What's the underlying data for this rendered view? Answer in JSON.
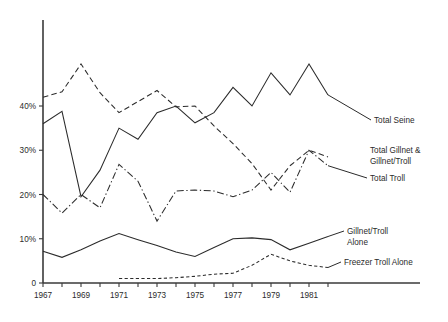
{
  "chart_data": {
    "type": "line",
    "title": "",
    "xlabel": "",
    "ylabel": "",
    "xlim": [
      1967,
      1983
    ],
    "ylim": [
      0,
      52
    ],
    "grid": false,
    "legend_position": "right-inline-labels",
    "x_tick_labels": [
      "1967",
      "1969",
      "1971",
      "1973",
      "1975",
      "1977",
      "1979",
      "1981"
    ],
    "x_tick_values": [
      1967,
      1969,
      1971,
      1973,
      1975,
      1977,
      1979,
      1981
    ],
    "x_minor_ticks": [
      1968,
      1970,
      1972,
      1974,
      1976,
      1978,
      1980,
      1982
    ],
    "y_tick_labels": [
      "0",
      "10%",
      "20%",
      "30%",
      "40%"
    ],
    "y_tick_values": [
      0,
      10,
      20,
      30,
      40
    ],
    "x": [
      1967,
      1968,
      1969,
      1970,
      1971,
      1972,
      1973,
      1974,
      1975,
      1976,
      1977,
      1978,
      1979,
      1980,
      1981,
      1982
    ],
    "series": [
      {
        "name": "Total Seine",
        "style": "solid",
        "label": "Total Seine",
        "values": [
          36.0,
          38.8,
          19.5,
          25.5,
          35.0,
          32.5,
          38.5,
          40.0,
          36.2,
          38.5,
          44.2,
          40.0,
          47.5,
          42.5,
          49.5,
          42.5
        ]
      },
      {
        "name": "Total Gillnet & Gillnet/Troll",
        "style": "dashed",
        "label": "Total Gillnet &\nGillnet/Troll",
        "label_line1": "Total Gillnet &",
        "label_line2": "Gillnet/Troll",
        "values": [
          42.0,
          43.2,
          49.5,
          43.0,
          38.5,
          41.0,
          43.5,
          39.8,
          40.0,
          35.5,
          31.5,
          27.0,
          21.0,
          26.5,
          30.0,
          28.5
        ]
      },
      {
        "name": "Total Troll",
        "style": "dashdot",
        "label": "Total Troll",
        "values": [
          20.0,
          15.8,
          20.0,
          17.0,
          26.8,
          23.0,
          14.0,
          20.8,
          21.0,
          20.8,
          19.5,
          21.0,
          25.0,
          20.5,
          30.0,
          26.5
        ]
      },
      {
        "name": "Gillnet/Troll Alone",
        "style": "solid",
        "label": "Gillnet/Troll\nAlone",
        "label_line1": "Gillnet/Troll",
        "label_line2": "Alone",
        "values": [
          7.2,
          5.8,
          7.5,
          9.5,
          11.2,
          9.8,
          8.5,
          7.0,
          6.0,
          8.0,
          10.0,
          10.2,
          9.8,
          7.5,
          9.0,
          10.5
        ]
      },
      {
        "name": "Freezer Troll Alone",
        "style": "fine-dashed",
        "label": "Freezer Troll Alone",
        "values": [
          null,
          null,
          null,
          null,
          1.0,
          1.0,
          1.0,
          1.2,
          1.5,
          2.0,
          2.2,
          4.0,
          6.5,
          5.0,
          4.0,
          3.5
        ]
      }
    ],
    "annotations": [
      {
        "id": "label-total-seine",
        "text": "Total Seine"
      },
      {
        "id": "label-total-gillnet",
        "text": "Total Gillnet & Gillnet/Troll"
      },
      {
        "id": "label-total-troll",
        "text": "Total Troll"
      },
      {
        "id": "label-gillnet-troll-alone",
        "text": "Gillnet/Troll Alone"
      },
      {
        "id": "label-freezer-troll-alone",
        "text": "Freezer Troll Alone"
      }
    ]
  },
  "axis": {
    "y_ticks": [
      {
        "label": "40%",
        "value": 40
      },
      {
        "label": "30%",
        "value": 30
      },
      {
        "label": "20%",
        "value": 20
      },
      {
        "label": "10%",
        "value": 10
      },
      {
        "label": "0",
        "value": 0
      }
    ],
    "x_ticks": [
      {
        "label": "1967",
        "value": 1967
      },
      {
        "label": "1969",
        "value": 1969
      },
      {
        "label": "1971",
        "value": 1971
      },
      {
        "label": "1973",
        "value": 1973
      },
      {
        "label": "1975",
        "value": 1975
      },
      {
        "label": "1977",
        "value": 1977
      },
      {
        "label": "1979",
        "value": 1979
      },
      {
        "label": "1981",
        "value": 1981
      }
    ]
  },
  "legend": {
    "total_seine": "Total Seine",
    "total_gillnet_l1": "Total Gillnet &",
    "total_gillnet_l2": "Gillnet/Troll",
    "total_troll": "Total Troll",
    "gillnet_troll_alone_l1": "Gillnet/Troll",
    "gillnet_troll_alone_l2": "Alone",
    "freezer_troll_alone": "Freezer Troll Alone"
  },
  "colors": {
    "ink": "#2b2b2b",
    "axis": "#3a3a3a",
    "background": "#ffffff"
  }
}
